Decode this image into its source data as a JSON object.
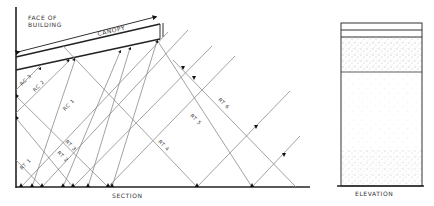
{
  "section": {
    "title": "SECTION",
    "face_label_line1": "FACE OF",
    "face_label_line2": "BUILDING",
    "canopy_label": "CANOPY",
    "reflected_canopy_labels": [
      "RC 3",
      "RC 2",
      "RC 1"
    ],
    "reflected_terrain_labels": [
      "RT 1",
      "RT 2",
      "RT 3",
      "RT 4",
      "RT 5",
      "RT 6"
    ]
  },
  "elevation": {
    "title": "ELEVATION",
    "bands": [
      "canopy-edge",
      "canopy-fascia",
      "dense-stipple",
      "light-stipple"
    ]
  },
  "colors": {
    "ink": "#222222",
    "ray": "#8a8a8a",
    "stipple": "#777777"
  }
}
